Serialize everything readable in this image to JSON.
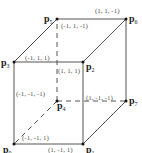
{
  "diagram": {
    "type": "cube",
    "colors": {
      "edge": "#555555",
      "vertex": "#111111",
      "label": "#555555"
    },
    "vertices": [
      {
        "id": "P0",
        "name": "p",
        "sub": "0",
        "coord": "(-1, -1, 1)",
        "x": 14,
        "y": 144
      },
      {
        "id": "P1",
        "name": "p",
        "sub": "1",
        "coord": "(1, -1, 1)",
        "x": 83,
        "y": 144
      },
      {
        "id": "P2",
        "name": "p",
        "sub": "2",
        "coord": "(1, 1, 1)",
        "x": 83,
        "y": 62
      },
      {
        "id": "P3",
        "name": "p",
        "sub": "3",
        "coord": "(-1, 1, 1)",
        "x": 14,
        "y": 62
      },
      {
        "id": "P4",
        "name": "p",
        "sub": "4",
        "coord": "(-1, -1, -1)",
        "x": 57,
        "y": 101
      },
      {
        "id": "P5",
        "name": "p",
        "sub": "5",
        "coord": "(-1, 1, -1)",
        "x": 57,
        "y": 19
      },
      {
        "id": "P6",
        "name": "p",
        "sub": "6",
        "coord": "(1, 1, -1)",
        "x": 126,
        "y": 19
      },
      {
        "id": "P7",
        "name": "p",
        "sub": "7",
        "coord": "(1, -1, -1)",
        "x": 126,
        "y": 101
      }
    ]
  }
}
